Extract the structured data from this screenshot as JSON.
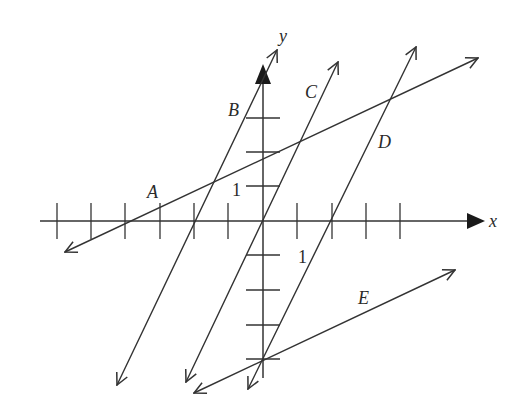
{
  "diagram": {
    "title": "",
    "axes": {
      "x_label": "x",
      "y_label": "y",
      "x_unit_label": "1",
      "y_unit_label": "1",
      "origin_px": [
        263,
        221
      ],
      "unit_px": 34.5,
      "x_ticks": [
        -6,
        -5,
        -4,
        -3,
        -2,
        -1,
        1,
        2,
        3,
        4
      ],
      "y_ticks": [
        -4,
        -3,
        -2,
        -1,
        1,
        2,
        3
      ]
    },
    "lines": [
      {
        "label": "A",
        "slope": 0.5,
        "y_intercept": 2,
        "x_intercept": -4
      },
      {
        "label": "B",
        "slope": 2,
        "y_intercept": 4,
        "x_intercept": -2
      },
      {
        "label": "C",
        "slope": 2,
        "y_intercept": 0,
        "x_intercept": 0
      },
      {
        "label": "D",
        "slope": 2,
        "y_intercept": -4,
        "x_intercept": 2
      },
      {
        "label": "E",
        "slope": 0.5,
        "y_intercept": -4,
        "x_intercept": 8
      }
    ],
    "colors": {
      "ink": "#333333",
      "background": "#ffffff"
    }
  }
}
